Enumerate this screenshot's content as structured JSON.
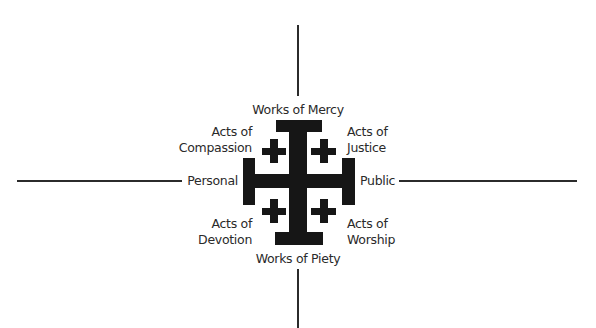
{
  "diagram": {
    "type": "jerusalem-cross-quadrant",
    "colors": {
      "cross": "#161616",
      "axis": "#2b2b2b",
      "text": "#2a2a2a",
      "background": "#ffffff"
    },
    "axes": {
      "top": "Works of Mercy",
      "bottom": "Works of Piety",
      "left": "Personal",
      "right": "Public"
    },
    "quadrants": {
      "top_left": {
        "line1": "Acts of",
        "line2": "Compassion"
      },
      "top_right": {
        "line1": "Acts of",
        "line2": "Justice"
      },
      "bottom_left": {
        "line1": "Acts of",
        "line2": "Devotion"
      },
      "bottom_right": {
        "line1": "Acts of",
        "line2": "Worship"
      }
    }
  }
}
